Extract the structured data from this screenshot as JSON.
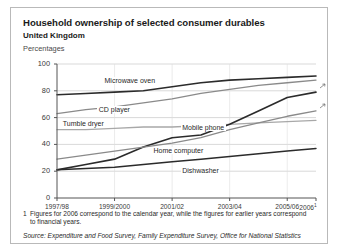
{
  "figure": {
    "title": "Household ownership of selected consumer durables",
    "subtitle": "United Kingdom",
    "units": "Percentages",
    "footnote_marker": "1",
    "footnote": "Figures for 2006 correspond to the calendar year, while the figures for earlier years correspond to financial years.",
    "source": "Source: Expenditure and Food Survey, Family Expenditure Survey, Office for National Statistics",
    "colors": {
      "frame": "#b9b9b9",
      "grid": "#c8c8c8",
      "axis": "#555555",
      "dark_line": "#2b2b2b",
      "mid_line": "#8a8a8a",
      "light_line": "#a8a8a8",
      "text": "#1a1a1a"
    }
  },
  "chart_data": {
    "type": "line",
    "title": "Household ownership of selected consumer durables",
    "subtitle": "United Kingdom",
    "xlabel": "",
    "ylabel": "Percentages",
    "ylim": [
      0,
      100
    ],
    "yticks": [
      0,
      20,
      40,
      60,
      80,
      100
    ],
    "grid": true,
    "legend": "inline-labels",
    "x": [
      "1997/98",
      "1998/99",
      "1999/2000",
      "2000/01",
      "2001/02",
      "2002/03",
      "2003/04",
      "2004/05",
      "2005/06",
      "2006"
    ],
    "xticks": [
      "1997/98",
      "1999/2000",
      "2001/02",
      "2003/04",
      "2005/06",
      "2006"
    ],
    "xtick_indices": [
      0,
      2,
      4,
      6,
      8,
      9
    ],
    "series": [
      {
        "name": "Microwave oven",
        "color": "#2b2b2b",
        "width": 1.6,
        "values": [
          77,
          78,
          79,
          80,
          83,
          86,
          88,
          89,
          90,
          91
        ],
        "label_x_index": 1.6,
        "label_y": 87
      },
      {
        "name": "CD player",
        "color": "#8a8a8a",
        "width": 1.3,
        "values": [
          63,
          66,
          68,
          71,
          74,
          78,
          81,
          84,
          86,
          88
        ],
        "label_x_index": 1.4,
        "label_y": 65
      },
      {
        "name": "Tumble dryer",
        "color": "#a8a8a8",
        "width": 1.3,
        "values": [
          51,
          51,
          52,
          53,
          53,
          54,
          55,
          56,
          57,
          58
        ],
        "label_x_index": 0.15,
        "label_y": 55
      },
      {
        "name": "Mobile phone",
        "color": "#2b2b2b",
        "width": 1.6,
        "values": [
          21,
          25,
          29,
          38,
          45,
          47,
          55,
          65,
          75,
          79
        ],
        "label_x_index": 4.3,
        "label_y": 52
      },
      {
        "name": "Home computer",
        "color": "#8a8a8a",
        "width": 1.3,
        "values": [
          29,
          32,
          35,
          38,
          41,
          45,
          51,
          56,
          61,
          65
        ],
        "label_x_index": 3.3,
        "label_y": 35
      },
      {
        "name": "Dishwasher",
        "color": "#2b2b2b",
        "width": 1.5,
        "values": [
          21,
          22,
          23,
          25,
          27,
          29,
          31,
          33,
          35,
          37
        ],
        "label_x_index": 4.3,
        "label_y": 20
      }
    ]
  }
}
